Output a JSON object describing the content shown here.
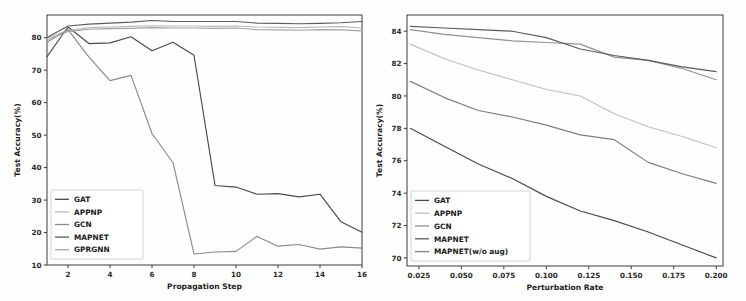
{
  "figure": {
    "background": "#ffffff",
    "panel_count": 2
  },
  "chart_data": [
    {
      "id": "left",
      "type": "line",
      "title": "",
      "xlabel": "Propagation Step",
      "ylabel": "Test Accuracy(%)",
      "xlim": [
        1,
        16
      ],
      "ylim": [
        10,
        87
      ],
      "xticks": [
        2,
        4,
        6,
        8,
        10,
        12,
        14,
        16
      ],
      "xticklabels": [
        "2",
        "4",
        "6",
        "8",
        "10",
        "12",
        "14",
        "16"
      ],
      "yticks": [
        10,
        20,
        30,
        40,
        50,
        60,
        70,
        80
      ],
      "yticklabels": [
        "10",
        "20",
        "30",
        "40",
        "50",
        "60",
        "70",
        "80"
      ],
      "grid": false,
      "legend_position": "lower left",
      "x": [
        1,
        2,
        3,
        4,
        5,
        6,
        7,
        8,
        9,
        10,
        11,
        12,
        13,
        14,
        15,
        16
      ],
      "series": [
        {
          "name": "GAT",
          "color": "#4a4a4a",
          "values": [
            74.2,
            83.3,
            78.2,
            78.4,
            80.3,
            76.0,
            78.6,
            74.6,
            34.5,
            34.0,
            31.8,
            32.0,
            31.0,
            31.8,
            23.3,
            20.1
          ]
        },
        {
          "name": "APPNP",
          "color": "#b9b9b9",
          "values": [
            79.9,
            82.2,
            83.1,
            83.3,
            83.5,
            83.7,
            83.6,
            83.6,
            83.5,
            83.6,
            83.3,
            83.2,
            83.1,
            83.3,
            83.4,
            83.0
          ]
        },
        {
          "name": "GCN",
          "color": "#8a8a8a",
          "values": [
            78.6,
            82.5,
            74.0,
            66.8,
            68.4,
            50.5,
            41.5,
            13.4,
            14.0,
            14.2,
            18.8,
            15.8,
            16.3,
            14.9,
            15.6,
            15.2
          ]
        },
        {
          "name": "MAPNET",
          "color": "#5c5c5c",
          "values": [
            80.1,
            83.6,
            84.2,
            84.5,
            84.8,
            85.3,
            85.0,
            85.0,
            85.0,
            85.0,
            84.5,
            84.4,
            84.3,
            84.4,
            84.6,
            85.0
          ]
        },
        {
          "name": "GPRGNN",
          "color": "#a3a3a3",
          "values": [
            79.4,
            81.9,
            82.6,
            82.8,
            82.9,
            83.1,
            83.0,
            83.0,
            82.9,
            83.0,
            82.5,
            82.4,
            82.3,
            82.5,
            82.4,
            82.1
          ]
        }
      ]
    },
    {
      "id": "right",
      "type": "line",
      "title": "",
      "xlabel": "Perturbation Rate",
      "ylabel": "Test Accuracy(%)",
      "xlim": [
        0.018,
        0.204
      ],
      "ylim": [
        69.5,
        85.0
      ],
      "xticks": [
        0.025,
        0.05,
        0.075,
        0.1,
        0.125,
        0.15,
        0.175,
        0.2
      ],
      "xticklabels": [
        "0.025",
        "0.050",
        "0.075",
        "0.100",
        "0.125",
        "0.150",
        "0.175",
        "0.200"
      ],
      "yticks": [
        70,
        72,
        74,
        76,
        78,
        80,
        82,
        84
      ],
      "yticklabels": [
        "70",
        "72",
        "74",
        "76",
        "78",
        "80",
        "82",
        "84"
      ],
      "grid": false,
      "legend_position": "lower left",
      "x": [
        0.02,
        0.04,
        0.06,
        0.08,
        0.1,
        0.12,
        0.14,
        0.16,
        0.18,
        0.2
      ],
      "series": [
        {
          "name": "GAT",
          "color": "#4a4a4a",
          "values": [
            78.0,
            76.9,
            75.8,
            74.9,
            73.8,
            72.9,
            72.3,
            71.6,
            70.8,
            70.0
          ]
        },
        {
          "name": "APPNP",
          "color": "#c0c0c0",
          "values": [
            83.2,
            82.3,
            81.6,
            81.0,
            80.4,
            80.0,
            78.9,
            78.1,
            77.5,
            76.8
          ]
        },
        {
          "name": "GCN",
          "color": "#909090",
          "values": [
            84.1,
            83.8,
            83.6,
            83.4,
            83.3,
            83.2,
            82.4,
            82.2,
            81.7,
            81.0
          ]
        },
        {
          "name": "MAPNET",
          "color": "#5c5c5c",
          "values": [
            84.3,
            84.2,
            84.1,
            84.0,
            83.6,
            82.9,
            82.5,
            82.2,
            81.8,
            81.5
          ]
        },
        {
          "name": "MAPNET(w/o aug)",
          "color": "#7e7e7e",
          "values": [
            80.9,
            79.9,
            79.1,
            78.7,
            78.2,
            77.6,
            77.3,
            75.9,
            75.2,
            74.6
          ]
        }
      ]
    }
  ]
}
